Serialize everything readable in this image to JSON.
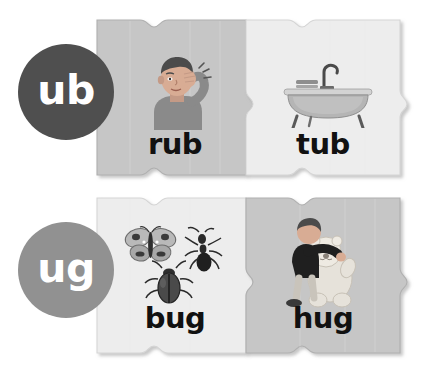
{
  "page": {
    "background_color": "#ffffff"
  },
  "rows": [
    {
      "id": "ub",
      "badge": {
        "label": "ub",
        "color": "#4f4f4f",
        "text_color": "#ffffff",
        "icon": "circle-badge"
      },
      "pieces": [
        {
          "word": "rub",
          "fill": "#c6c6c6",
          "edge": "#b2b2b2",
          "art": "man-rubbing-eye-illustration"
        },
        {
          "word": "tub",
          "fill": "#ededed",
          "edge": "#d8d8d8",
          "art": "clawfoot-bathtub-illustration"
        }
      ]
    },
    {
      "id": "ug",
      "badge": {
        "label": "ug",
        "color": "#919191",
        "text_color": "#ffffff",
        "icon": "circle-badge"
      },
      "pieces": [
        {
          "word": "bug",
          "fill": "#ededed",
          "edge": "#d8d8d8",
          "art": "insects-butterfly-ant-beetle-illustration"
        },
        {
          "word": "hug",
          "fill": "#c6c6c6",
          "edge": "#b2b2b2",
          "art": "child-hugging-teddy-bear-illustration"
        }
      ]
    }
  ],
  "colors": {
    "word_text": "#111111",
    "badge_dark": "#4f4f4f",
    "badge_light": "#919191",
    "piece_dark": "#c6c6c6",
    "piece_light": "#ededed",
    "page_background": "#ffffff"
  }
}
